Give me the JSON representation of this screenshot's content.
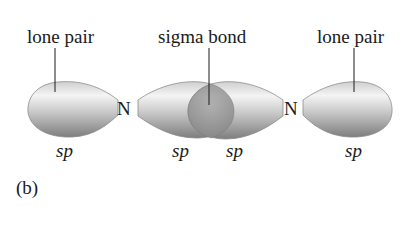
{
  "figure": {
    "panel_label": "(b)",
    "labels": {
      "left_lone_pair": "lone pair",
      "sigma_bond": "sigma bond",
      "right_lone_pair": "lone pair"
    },
    "atoms": [
      "N",
      "N"
    ],
    "orbital_labels": [
      "sp",
      "sp",
      "sp",
      "sp"
    ],
    "colors": {
      "orbital_light": "#f2f2f2",
      "orbital_dark": "#8a8a8a",
      "overlap": "#9a9a9a",
      "text": "#1a1a1a"
    }
  }
}
